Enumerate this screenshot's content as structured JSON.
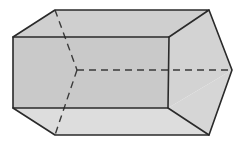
{
  "diagram": {
    "type": "3d-solid",
    "colors": {
      "background": "#ffffff",
      "front_face": "#c9c9c9",
      "top_face": "#cfcfcf",
      "right_face": "#d3d3d3",
      "bottom_face": "#dddddd",
      "edge": "#2a2a2a"
    },
    "vertices": {
      "front_top_left": [
        13,
        37
      ],
      "front_top_right": [
        169,
        37
      ],
      "front_bottom_right": [
        168,
        108
      ],
      "front_bottom_left": [
        13,
        108
      ],
      "back_top_left": [
        55,
        10
      ],
      "back_top_right": [
        209,
        10
      ],
      "back_apex_left_hidden": [
        77,
        70
      ],
      "back_apex_right": [
        232,
        70
      ],
      "back_bottom_right": [
        209,
        135
      ],
      "back_bottom_left": [
        55,
        135
      ]
    }
  }
}
